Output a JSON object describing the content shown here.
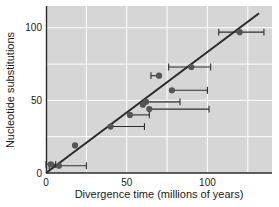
{
  "chart_data": {
    "type": "scatter",
    "title": "",
    "xlabel": "Divergence time (millions of years)",
    "ylabel": "Nucleotide substitutions",
    "xlim": [
      0,
      140
    ],
    "ylim": [
      0,
      115
    ],
    "xticks": [
      0,
      50,
      100
    ],
    "xtick_labels": [
      "0",
      "50",
      "100"
    ],
    "yticks": [
      0,
      50,
      100
    ],
    "ytick_labels": [
      "0",
      "50",
      "100"
    ],
    "grid": true,
    "gridlines_x": [
      25,
      50,
      75,
      100,
      125
    ],
    "gridlines_y": [
      25,
      50,
      75,
      100
    ],
    "legend": "none",
    "plot_background_color": "#d6d6d6",
    "point_color": "#555555",
    "line_color": "#2b2b2b",
    "gridline_color": "#ffffff",
    "series": [
      {
        "name": "species pairs",
        "points": [
          {
            "x": 3,
            "y": 6,
            "xerr_low": 3,
            "xerr_high": 3
          },
          {
            "x": 8,
            "y": 5,
            "xerr_low": 6,
            "xerr_high": 17
          },
          {
            "x": 18,
            "y": 19,
            "xerr_low": 0,
            "xerr_high": 0
          },
          {
            "x": 40,
            "y": 32,
            "xerr_low": 0,
            "xerr_high": 21
          },
          {
            "x": 52,
            "y": 40,
            "xerr_low": 0,
            "xerr_high": 12
          },
          {
            "x": 60,
            "y": 47,
            "xerr_low": 0,
            "xerr_high": 0
          },
          {
            "x": 62,
            "y": 49,
            "xerr_low": 0,
            "xerr_high": 21
          },
          {
            "x": 64,
            "y": 44,
            "xerr_low": 0,
            "xerr_high": 37
          },
          {
            "x": 70,
            "y": 67,
            "xerr_low": 5,
            "xerr_high": 0
          },
          {
            "x": 78,
            "y": 57,
            "xerr_low": 0,
            "xerr_high": 22
          },
          {
            "x": 90,
            "y": 73,
            "xerr_low": 14,
            "xerr_high": 12
          },
          {
            "x": 120,
            "y": 97,
            "xerr_low": 13,
            "xerr_high": 15
          }
        ]
      }
    ],
    "trendline": {
      "type": "linear",
      "x_start": 0,
      "y_start": 0,
      "x_end": 132,
      "y_end": 110
    }
  }
}
